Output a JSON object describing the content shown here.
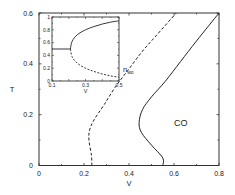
{
  "chart_data": [
    {
      "type": "line",
      "title": "",
      "xlabel": "V",
      "ylabel": "T",
      "xlim": [
        0,
        0.8
      ],
      "ylim": [
        0,
        0.6
      ],
      "xticks": [
        "0",
        "0.2",
        "0.4",
        "0.6",
        "0.8"
      ],
      "yticks": [
        "0",
        "0.2",
        "0.4",
        "0.6"
      ],
      "grid": false,
      "annotations": [
        {
          "text": "CO",
          "x": 0.63,
          "y": 0.17
        },
        {
          "text": "n_wo",
          "x": 0.4,
          "y": 0.41
        }
      ],
      "series": [
        {
          "name": "dashed boundary",
          "style": "dashed",
          "points": [
            [
              0.235,
              0.0
            ],
            [
              0.233,
              0.04
            ],
            [
              0.222,
              0.1
            ],
            [
              0.225,
              0.14
            ],
            [
              0.245,
              0.18
            ],
            [
              0.29,
              0.24
            ],
            [
              0.34,
              0.31
            ],
            [
              0.4,
              0.38
            ],
            [
              0.46,
              0.45
            ],
            [
              0.52,
              0.51
            ],
            [
              0.61,
              0.6
            ]
          ]
        },
        {
          "name": "solid boundary",
          "style": "solid",
          "points": [
            [
              0.55,
              0.0
            ],
            [
              0.55,
              0.03
            ],
            [
              0.5,
              0.08
            ],
            [
              0.455,
              0.13
            ],
            [
              0.445,
              0.17
            ],
            [
              0.46,
              0.22
            ],
            [
              0.5,
              0.27
            ],
            [
              0.56,
              0.33
            ],
            [
              0.63,
              0.41
            ],
            [
              0.7,
              0.49
            ],
            [
              0.8,
              0.6
            ]
          ]
        }
      ]
    },
    {
      "type": "line",
      "title": "inset",
      "xlabel": "V",
      "ylabel": "",
      "xlim": [
        0.1,
        0.5
      ],
      "ylim": [
        0,
        1
      ],
      "xticks": [
        "0.1",
        "0.3",
        "0.5"
      ],
      "yticks": [
        "0",
        "0.2",
        "0.4",
        "0.6",
        "0.8",
        "1"
      ],
      "series": [
        {
          "name": "upper branch",
          "style": "solid",
          "points": [
            [
              0.1,
              0.5
            ],
            [
              0.21,
              0.5
            ],
            [
              0.22,
              0.62
            ],
            [
              0.25,
              0.72
            ],
            [
              0.3,
              0.8
            ],
            [
              0.35,
              0.85
            ],
            [
              0.4,
              0.89
            ],
            [
              0.45,
              0.92
            ],
            [
              0.5,
              0.94
            ]
          ]
        },
        {
          "name": "lower branch",
          "style": "dashed",
          "points": [
            [
              0.21,
              0.5
            ],
            [
              0.22,
              0.38
            ],
            [
              0.25,
              0.28
            ],
            [
              0.3,
              0.2
            ],
            [
              0.35,
              0.15
            ],
            [
              0.4,
              0.11
            ],
            [
              0.45,
              0.08
            ],
            [
              0.5,
              0.06
            ]
          ]
        }
      ]
    }
  ]
}
